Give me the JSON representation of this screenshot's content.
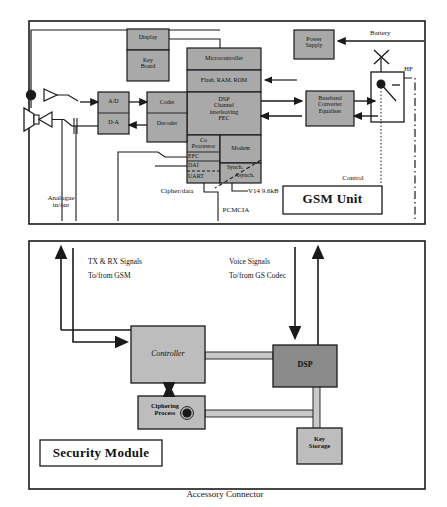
{
  "diagram": {
    "title_top": "GSM Unit",
    "title_bottom": "Security Module",
    "caption": "Accessory Connector",
    "colors": {
      "block_fill": "#a9a9a9",
      "block_fill_light": "#bdbdbd",
      "dsp_fill": "#8a8a8a",
      "bus_fill": "#c9c9c9",
      "stroke": "#1a1a1a",
      "panel_bg": "#ffffff"
    }
  },
  "gsm_unit": {
    "panel_label": "GSM Unit",
    "blocks": {
      "display": "Display",
      "keyboard": "Key\nBoard",
      "microcontroller": "Microcontroller",
      "memory": "Flash. RAM. ROM",
      "dsp": "DSP\nChannel\ninterleaving\nFEC",
      "coprocessor": "Co\nProcessor",
      "efc": "EFC",
      "dai": "DAI",
      "uart": "UART",
      "modem": "Modem",
      "synch": "Synch.",
      "asynch": "Asynch.",
      "adc": "A/D",
      "dac": "D-A",
      "coder": "Coder",
      "decoder": "Decoder",
      "baseband": "Baseband\nConverter\nEqualiser",
      "power_supply": "Power\nSupply"
    },
    "wire_labels": {
      "battery": "Battery",
      "hf": "HF",
      "control": "Control",
      "analogue": "Analogue\nin/out",
      "cipher_data": "Cipher/data",
      "v14": "V14 9.6kB",
      "pcmcia": "PCMCIA"
    }
  },
  "security_module": {
    "panel_label": "Security Module",
    "blocks": {
      "controller": "Controller",
      "dsp": "DSP",
      "ciphering": "Ciphering\nProcess",
      "key_storage": "Key\nStorage"
    },
    "signal_labels": {
      "tx_rx_line1": "TX & RX Signals",
      "tx_rx_line2": "To/from GSM",
      "voice_line1": "Voice Signals",
      "voice_line2": "To/from GS Codec"
    }
  }
}
